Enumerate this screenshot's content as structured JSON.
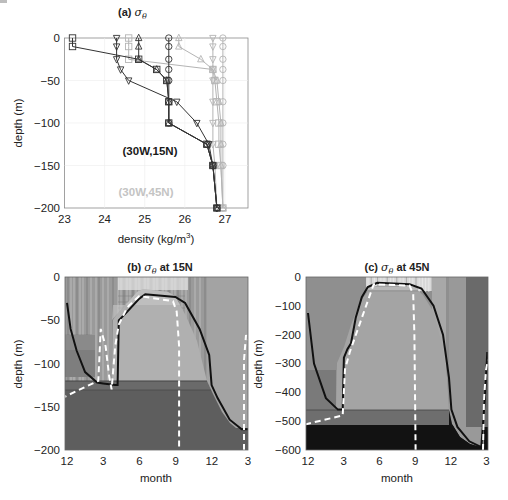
{
  "chart_data": [
    {
      "type": "line",
      "panel": "a",
      "title": "(a) σθ",
      "xlabel": "density (kg/m3)",
      "ylabel": "depth (m)",
      "xlim": [
        23,
        27.57
      ],
      "ylim": [
        -200,
        0
      ],
      "xticks": [
        "23",
        "24",
        "25",
        "26",
        "27"
      ],
      "yticks": [
        "0",
        "-50",
        "-100",
        "-150",
        "-200"
      ],
      "grid": true,
      "annotations": [
        {
          "text": "(30W,15N)",
          "color": "#1a1a1a"
        },
        {
          "text": "(30W,45N)",
          "color": "#b4b4b4"
        }
      ],
      "series": [
        {
          "name": "15N squares",
          "group": "(30W,15N)",
          "marker": "square",
          "color": "#333333",
          "points": [
            [
              23.2,
              0
            ],
            [
              23.2,
              -10
            ],
            [
              24.85,
              -25
            ],
            [
              25.3,
              -37
            ],
            [
              25.55,
              -50
            ],
            [
              25.6,
              -75
            ],
            [
              25.6,
              -100
            ],
            [
              26.55,
              -125
            ],
            [
              26.7,
              -150
            ],
            [
              26.8,
              -200
            ]
          ]
        },
        {
          "name": "15N down-triangles",
          "group": "(30W,15N)",
          "marker": "triangle-down",
          "color": "#333333",
          "points": [
            [
              24.3,
              0
            ],
            [
              24.3,
              -10
            ],
            [
              24.3,
              -25
            ],
            [
              24.4,
              -37
            ],
            [
              24.6,
              -50
            ],
            [
              25.8,
              -75
            ],
            [
              26.3,
              -100
            ],
            [
              26.6,
              -125
            ],
            [
              26.7,
              -150
            ],
            [
              26.8,
              -200
            ]
          ]
        },
        {
          "name": "15N up-triangles",
          "group": "(30W,15N)",
          "marker": "triangle-up",
          "color": "#333333",
          "points": [
            [
              24.85,
              0
            ],
            [
              24.85,
              -10
            ],
            [
              24.85,
              -25
            ],
            [
              25.3,
              -37
            ],
            [
              25.55,
              -50
            ],
            [
              25.6,
              -75
            ],
            [
              25.6,
              -100
            ],
            [
              26.55,
              -125
            ],
            [
              26.7,
              -150
            ],
            [
              26.8,
              -200
            ]
          ]
        },
        {
          "name": "15N circles",
          "group": "(30W,15N)",
          "marker": "circle",
          "color": "#333333",
          "points": [
            [
              25.6,
              0
            ],
            [
              25.6,
              -10
            ],
            [
              25.6,
              -25
            ],
            [
              25.6,
              -37
            ],
            [
              25.6,
              -50
            ],
            [
              25.6,
              -75
            ],
            [
              25.6,
              -100
            ],
            [
              26.55,
              -125
            ],
            [
              26.7,
              -150
            ],
            [
              26.8,
              -200
            ]
          ]
        },
        {
          "name": "45N squares",
          "group": "(30W,45N)",
          "marker": "square",
          "color": "#b4b4b4",
          "points": [
            [
              24.6,
              0
            ],
            [
              24.6,
              -10
            ],
            [
              24.6,
              -25
            ],
            [
              26.7,
              -37
            ],
            [
              26.75,
              -50
            ],
            [
              26.8,
              -75
            ],
            [
              26.85,
              -100
            ],
            [
              26.85,
              -125
            ],
            [
              26.9,
              -150
            ],
            [
              26.95,
              -200
            ]
          ]
        },
        {
          "name": "45N up-triangles",
          "group": "(30W,45N)",
          "marker": "triangle-up",
          "color": "#b4b4b4",
          "points": [
            [
              25.85,
              0
            ],
            [
              25.85,
              -10
            ],
            [
              26.4,
              -25
            ],
            [
              26.7,
              -37
            ],
            [
              26.8,
              -50
            ],
            [
              26.85,
              -75
            ],
            [
              26.9,
              -100
            ],
            [
              26.9,
              -125
            ],
            [
              26.9,
              -150
            ],
            [
              26.95,
              -200
            ]
          ]
        },
        {
          "name": "45N down-triangles",
          "group": "(30W,45N)",
          "marker": "triangle-down",
          "color": "#b4b4b4",
          "points": [
            [
              26.7,
              0
            ],
            [
              26.7,
              -10
            ],
            [
              26.7,
              -25
            ],
            [
              26.7,
              -37
            ],
            [
              26.7,
              -50
            ],
            [
              26.7,
              -75
            ],
            [
              26.7,
              -100
            ],
            [
              26.7,
              -125
            ],
            [
              26.75,
              -150
            ],
            [
              26.8,
              -200
            ]
          ]
        },
        {
          "name": "45N circles",
          "group": "(30W,45N)",
          "marker": "circle",
          "color": "#b4b4b4",
          "points": [
            [
              26.95,
              0
            ],
            [
              26.95,
              -10
            ],
            [
              26.95,
              -25
            ],
            [
              26.95,
              -37
            ],
            [
              26.95,
              -50
            ],
            [
              26.95,
              -75
            ],
            [
              26.95,
              -100
            ],
            [
              26.95,
              -125
            ],
            [
              26.95,
              -150
            ],
            [
              26.95,
              -200
            ]
          ]
        }
      ]
    },
    {
      "type": "heatmap",
      "panel": "b",
      "title": "(b) σθ at 15N",
      "xlabel": "month",
      "ylabel": "depth (m)",
      "ylim": [
        -200,
        0
      ],
      "xticks": [
        "12",
        "3",
        "6",
        "9",
        "12",
        "3"
      ],
      "yticks": [
        "0",
        "-50",
        "-100",
        "-150",
        "-200"
      ],
      "series": [
        {
          "name": "solid black contour (mixed-layer boundary)",
          "points": [
            [
              12,
              -30
            ],
            [
              12.3,
              -60
            ],
            [
              12.8,
              -85
            ],
            [
              1.5,
              -110
            ],
            [
              2.5,
              -122
            ],
            [
              3,
              -123
            ],
            [
              4,
              -125
            ],
            [
              4.2,
              -125
            ],
            [
              4.3,
              -50
            ],
            [
              5,
              -40
            ],
            [
              6,
              -25
            ],
            [
              6.5,
              -20
            ],
            [
              9,
              -23
            ],
            [
              9.8,
              -30
            ],
            [
              11,
              -60
            ],
            [
              11.8,
              -90
            ],
            [
              12,
              -125
            ],
            [
              12.5,
              -140
            ],
            [
              13.5,
              -165
            ],
            [
              14.5,
              -176
            ],
            [
              15,
              -176
            ]
          ]
        },
        {
          "name": "white dashed contour",
          "points": [
            [
              2.5,
              -200
            ],
            [
              2.6,
              -120
            ],
            [
              2.8,
              -60
            ],
            [
              3.2,
              -80
            ],
            [
              3.5,
              -115
            ],
            [
              3.7,
              -130
            ],
            [
              4,
              -80
            ],
            [
              4.3,
              -55
            ],
            [
              5,
              -35
            ],
            [
              6,
              -22
            ],
            [
              8.8,
              -28
            ],
            [
              9.1,
              -40
            ],
            [
              9.3,
              -80
            ],
            [
              9.3,
              -200
            ]
          ]
        }
      ]
    },
    {
      "type": "heatmap",
      "panel": "c",
      "title": "(c) σθ at 45N",
      "xlabel": "month",
      "ylabel": "depth (m)",
      "ylim": [
        -600,
        0
      ],
      "xticks": [
        "12",
        "3",
        "6",
        "9",
        "12",
        "3"
      ],
      "yticks": [
        "0",
        "-100",
        "-200",
        "-300",
        "-400",
        "-500",
        "-600"
      ],
      "series": [
        {
          "name": "solid black contour (mixed-layer boundary)",
          "points": [
            [
              12,
              -125
            ],
            [
              12.5,
              -300
            ],
            [
              1.5,
              -420
            ],
            [
              2.5,
              -460
            ],
            [
              2.9,
              -460
            ],
            [
              3,
              -280
            ],
            [
              3.3,
              -250
            ],
            [
              3.6,
              -230
            ],
            [
              4,
              -140
            ],
            [
              4.5,
              -70
            ],
            [
              5,
              -35
            ],
            [
              5.8,
              -20
            ],
            [
              8.5,
              -25
            ],
            [
              9.5,
              -40
            ],
            [
              10.5,
              -100
            ],
            [
              11.3,
              -200
            ],
            [
              11.8,
              -350
            ],
            [
              12,
              -460
            ],
            [
              12.5,
              -520
            ],
            [
              13.5,
              -570
            ],
            [
              14.5,
              -590
            ],
            [
              14.8,
              -420
            ],
            [
              15,
              -260
            ]
          ]
        },
        {
          "name": "white dashed contour",
          "points": [
            [
              2.8,
              -600
            ],
            [
              2.9,
              -480
            ],
            [
              3.1,
              -320
            ],
            [
              3.5,
              -260
            ],
            [
              5.5,
              -25
            ],
            [
              8.5,
              -30
            ],
            [
              8.8,
              -60
            ],
            [
              8.9,
              -200
            ],
            [
              9,
              -600
            ]
          ]
        }
      ]
    }
  ],
  "panel_a": {
    "title_prefix": "(a) ",
    "title_symbol": "σ",
    "title_sub": "θ",
    "xlabel": "density (kg/m",
    "xlabel_sup": "3",
    "xlabel_end": ")",
    "ylabel": "depth (m)",
    "xticks": [
      "23",
      "24",
      "25",
      "26",
      "27"
    ],
    "yticks": [
      "0",
      "-50",
      "-100",
      "-150",
      "-200"
    ],
    "label_15n": "(30W,15N)",
    "label_45n": "(30W,45N)"
  },
  "panel_b": {
    "title_prefix": "(b) ",
    "title_symbol": "σ",
    "title_sub": "θ",
    "title_suffix": " at 15N",
    "xlabel": "month",
    "ylabel": "depth (m)",
    "xticks": [
      "12",
      "3",
      "6",
      "9",
      "12",
      "3"
    ],
    "yticks": [
      "0",
      "-50",
      "-100",
      "-150",
      "-200"
    ]
  },
  "panel_c": {
    "title_prefix": "(c) ",
    "title_symbol": "σ",
    "title_sub": "θ",
    "title_suffix": " at 45N",
    "xlabel": "month",
    "ylabel": "depth (m)",
    "xticks": [
      "12",
      "3",
      "6",
      "9",
      "12",
      "3"
    ],
    "yticks": [
      "0",
      "-100",
      "-200",
      "-300",
      "-400",
      "-500",
      "-600"
    ]
  },
  "colors": {
    "dark_series": "#333333",
    "light_series": "#b4b4b4",
    "contour": "#111111",
    "dashed": "#ffffff"
  }
}
